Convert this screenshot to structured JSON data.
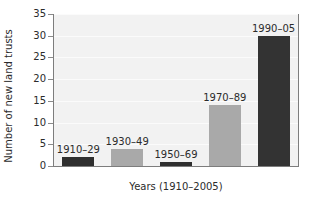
{
  "chart_data": {
    "type": "bar",
    "title": "",
    "xlabel": "Years (1910–2005)",
    "ylabel": "Number of new land trusts",
    "categories": [
      "1910–29",
      "1930–49",
      "1950–69",
      "1970–89",
      "1990–05"
    ],
    "values": [
      2,
      4,
      1,
      14,
      30
    ],
    "bar_colors": [
      "#2f2f2f",
      "#a9a9a9",
      "#2f2f2f",
      "#a9a9a9",
      "#333333"
    ],
    "bar_labels": [
      "1910–29",
      "1930–49",
      "1950–69",
      "1970–89",
      "1990–05"
    ],
    "ylim": [
      0,
      35
    ],
    "yticks": [
      0,
      5,
      10,
      15,
      20,
      25,
      30,
      35
    ],
    "ytick_labels": [
      "0",
      "5",
      "10",
      "15",
      "20",
      "25",
      "30",
      "35"
    ],
    "xticks": [],
    "xtick_labels": [],
    "grid": true,
    "grid_orientation": "horizontal",
    "legend": false,
    "legend_position": "none",
    "plot_background": "#f2f2f2",
    "figure_background": "#ffffff",
    "axis_color": "#7d7d7d",
    "text_color": "#2b2b2b"
  },
  "axis": {
    "y_title": "Number of new land trusts",
    "x_title": "Years (1910–2005)"
  }
}
